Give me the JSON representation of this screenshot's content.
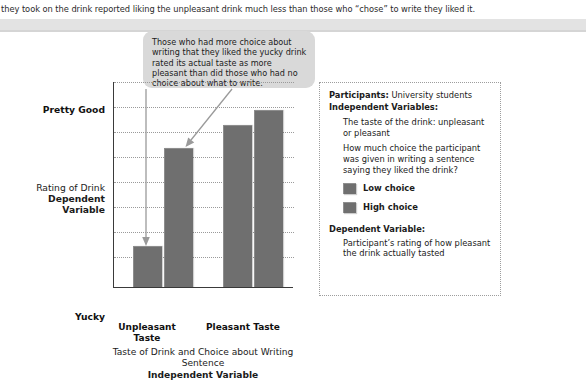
{
  "page": {
    "running_text": "they took on the drink reported liking the unpleasant drink much less than those who “chose” to write they liked it."
  },
  "callout": {
    "text": "Those who had more choice about writing that they liked the yucky drink rated its actual taste as more pleasant than did those who had no choice about what to write."
  },
  "info": {
    "participants_label": "Participants:",
    "participants_value": "University students",
    "iv_label": "Independent Variables:",
    "iv_items": [
      "The taste of the drink: unpleasant or pleasant",
      "How much choice the participant was given in writing a sentence saying they liked the drink?"
    ],
    "legend": [
      {
        "label": "Low choice",
        "color": "#6f6f6f"
      },
      {
        "label": "High choice",
        "color": "#6f6f6f"
      }
    ],
    "dv_label": "Dependent Variable:",
    "dv_text": "Participant’s rating of how pleasant the drink actually tasted"
  },
  "chart_data": {
    "type": "bar",
    "title": "",
    "xlabel": "Taste of Drink and Choice about Writing Sentence",
    "xlabel_sub": "Independent Variable",
    "ylabel": "Rating of Drink",
    "ylabel_sub": "Dependent Variable",
    "ylim": [
      0,
      100
    ],
    "ytick_labels": [
      "Pretty Good",
      "Yucky"
    ],
    "ytick_top": "Pretty Good",
    "ytick_bottom": "Yucky",
    "grid": true,
    "grid_lines": 8,
    "legend_position": "right-panel",
    "categories": [
      "Unpleasant Taste",
      "Pleasant Taste"
    ],
    "series": [
      {
        "name": "Low choice",
        "color": "#6f6f6f",
        "values": [
          19,
          78
        ]
      },
      {
        "name": "High choice",
        "color": "#6f6f6f",
        "values": [
          67,
          85
        ]
      }
    ],
    "bars": [
      {
        "category": "Unpleasant Taste",
        "series": "Low choice",
        "value": 19,
        "x": 19,
        "width": 28,
        "height_px": 40
      },
      {
        "category": "Unpleasant Taste",
        "series": "High choice",
        "value": 67,
        "x": 50,
        "width": 28,
        "height_px": 138
      },
      {
        "category": "Pleasant Taste",
        "series": "Low choice",
        "value": 78,
        "x": 109,
        "width": 28,
        "height_px": 161
      },
      {
        "category": "Pleasant Taste",
        "series": "High choice",
        "value": 85,
        "x": 140,
        "width": 28,
        "height_px": 176
      }
    ]
  }
}
